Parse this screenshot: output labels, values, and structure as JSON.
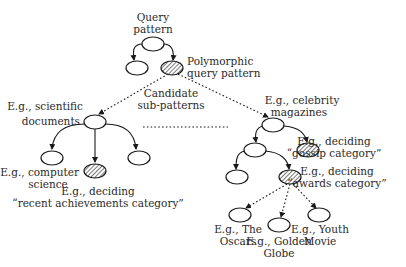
{
  "diagram": {
    "labels": {
      "query_pattern": [
        "Query",
        "pattern"
      ],
      "polymorphic": [
        "Polymorphic",
        "query pattern"
      ],
      "candidate": [
        "Candidate",
        "sub-patterns"
      ],
      "scientific": [
        "E.g., scientific",
        "documents"
      ],
      "computer_science": [
        "E.g., computer",
        "science"
      ],
      "recent": [
        "E.g., deciding",
        "“recent achievements category”"
      ],
      "celebrity": [
        "E.g., celebrity",
        "magazines"
      ],
      "gossip": [
        "E.g., deciding",
        "“gossip category”"
      ],
      "awards": [
        "E.g., deciding",
        "“awards category”"
      ],
      "oscars": [
        "E.g., The",
        "Oscars"
      ],
      "golden_globe": [
        "E.g., Golden",
        "Globe"
      ],
      "youth_movie": [
        "E.g., Youth",
        "Movie"
      ]
    },
    "colors": {
      "stroke": "#1a1a1a",
      "text": "#2a2a2a",
      "background": "#ffffff"
    }
  }
}
